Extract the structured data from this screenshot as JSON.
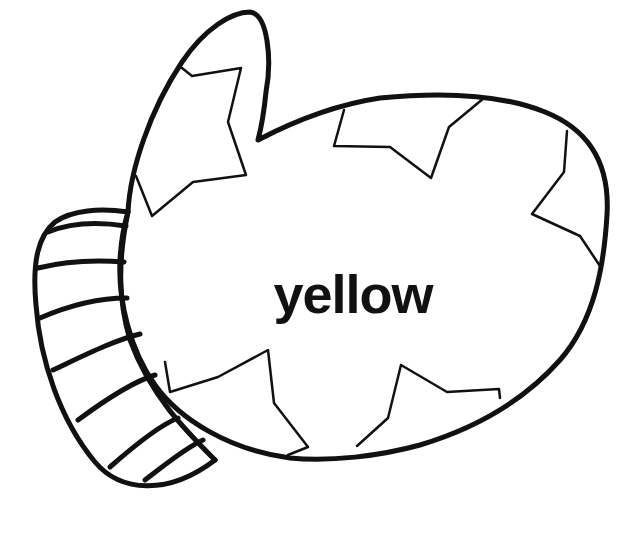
{
  "page": {
    "type": "coloring-page",
    "word": "yellow",
    "colors": {
      "background": "#ffffff",
      "outline": "#111111",
      "text": "#111111"
    }
  },
  "illustration": {
    "parts": [
      "mitten-body",
      "thumb",
      "cuff",
      "star-patches"
    ],
    "cuff_stripe_count": 8,
    "star_patch_count": 6
  }
}
